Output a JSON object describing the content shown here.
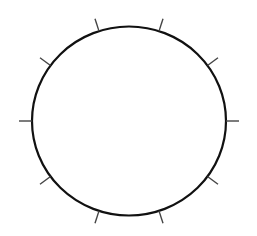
{
  "diagram": {
    "type": "circle-with-radial-ticks",
    "tick_count": 10,
    "tick_angle_step_degrees": 36,
    "tick_start_angle_degrees": 0,
    "colors": {
      "background": "#ffffff",
      "circle_stroke": "#111111",
      "tick_stroke": "#444444"
    }
  }
}
